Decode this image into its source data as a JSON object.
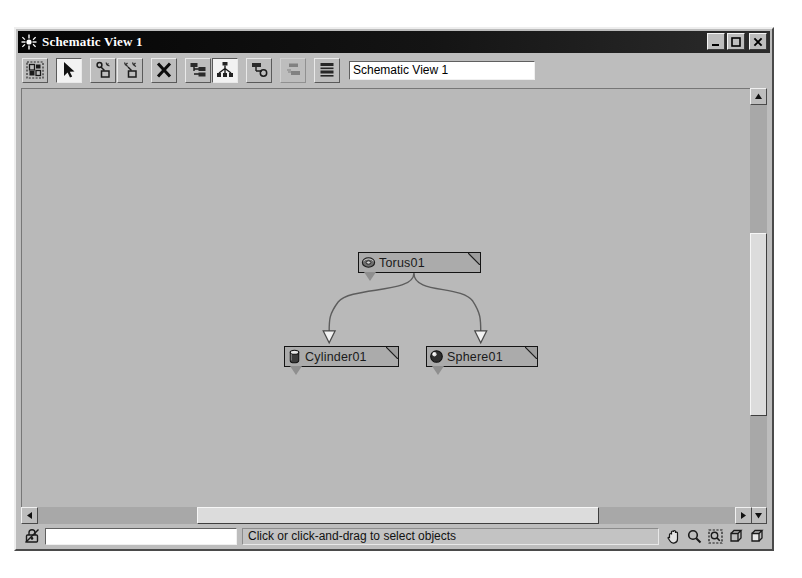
{
  "window": {
    "title": "Schematic View 1",
    "title_icon": "sun-starburst-icon",
    "controls": {
      "minimize": "minimize-button",
      "maximize": "maximize-button",
      "close": "close-button"
    }
  },
  "toolbar": {
    "view_name_value": "Schematic View 1",
    "view_name_placeholder": "Schematic View 1",
    "tools": [
      {
        "name": "display-floater-icon",
        "label": "Display Floater",
        "active": false,
        "disabled": false
      },
      {
        "name": "select-arrow-icon",
        "label": "Select",
        "active": true,
        "disabled": false
      },
      {
        "name": "connect-link-icon",
        "label": "Connect",
        "active": false,
        "disabled": false
      },
      {
        "name": "disconnect-link-icon",
        "label": "Disconnect",
        "active": false,
        "disabled": false
      },
      {
        "name": "delete-objects-icon",
        "label": "Delete Objects",
        "active": false,
        "disabled": false
      },
      {
        "name": "hierarchy-mode-icon",
        "label": "Hierarchy Mode",
        "active": false,
        "disabled": false
      },
      {
        "name": "reference-mode-icon",
        "label": "Reference Mode",
        "active": true,
        "disabled": false
      },
      {
        "name": "always-arrange-icon",
        "label": "Always Arrange",
        "active": false,
        "disabled": false
      },
      {
        "name": "arrange-children-icon",
        "label": "Arrange Children",
        "active": false,
        "disabled": true
      },
      {
        "name": "free-all-icon",
        "label": "Free All",
        "active": false,
        "disabled": false
      }
    ]
  },
  "canvas": {
    "nodes": [
      {
        "name": "node-torus01",
        "label": "Torus01",
        "icon": "torus-icon",
        "x": 336,
        "y": 163,
        "width": 123
      },
      {
        "name": "node-cylinder01",
        "label": "Cylinder01",
        "icon": "cylinder-icon",
        "x": 262,
        "y": 257,
        "width": 115
      },
      {
        "name": "node-sphere01",
        "label": "Sphere01",
        "icon": "sphere-icon",
        "x": 404,
        "y": 257,
        "width": 112
      }
    ],
    "links": [
      {
        "name": "link-torus01-cylinder01",
        "from": "Torus01",
        "to": "Cylinder01"
      },
      {
        "name": "link-torus01-sphere01",
        "from": "Torus01",
        "to": "Sphere01"
      }
    ],
    "background_color": "#b9b9b9",
    "node_fill_color": "#ababab",
    "node_border_color": "#141414"
  },
  "scrollbars": {
    "vertical": {
      "name": "vertical-scrollbar",
      "thumb_top_pct": 30,
      "thumb_height_pct": 42
    },
    "horizontal": {
      "name": "horizontal-scrollbar",
      "thumb_left_pct": 24,
      "thumb_width_pct": 55
    }
  },
  "statusbar": {
    "lock_icon": "lock-selection-icon",
    "input_value": "",
    "input_placeholder": "",
    "message": "Click or click-and-drag to select objects",
    "nav_tools": [
      {
        "name": "pan-hand-icon",
        "label": "Pan"
      },
      {
        "name": "zoom-magnifier-icon",
        "label": "Zoom"
      },
      {
        "name": "zoom-region-icon",
        "label": "Zoom Region"
      },
      {
        "name": "zoom-extents-icon",
        "label": "Zoom Extents"
      },
      {
        "name": "zoom-extents-selected-icon",
        "label": "Zoom Extents Selected"
      }
    ]
  }
}
